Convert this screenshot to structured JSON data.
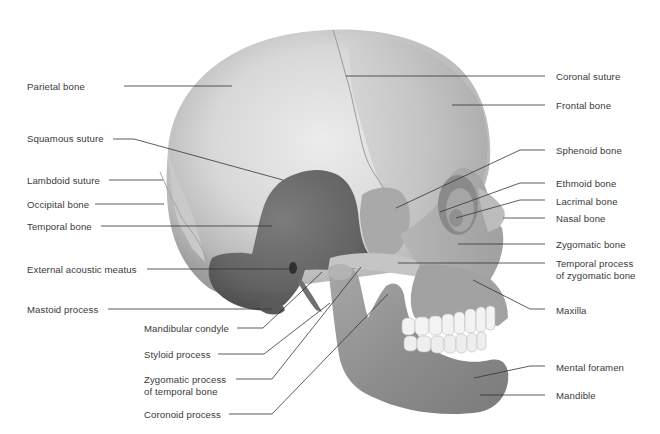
{
  "diagram": {
    "colors": {
      "background": "#ffffff",
      "bone_light": "#e2e2e2",
      "bone_mid": "#bdbdbd",
      "bone_dark": "#8f8f8f",
      "temporal": "#6d6d6d",
      "temporal_dark": "#555555",
      "teeth": "#f4f4f4",
      "leader_line": "#333333",
      "label_text": "#3a3a3a"
    },
    "labels_left": [
      {
        "id": "parietal-bone",
        "text": "Parietal bone",
        "x": 27,
        "y": 81,
        "line": [
          [
            124,
            86
          ],
          [
            232,
            86
          ]
        ]
      },
      {
        "id": "squamous-suture",
        "text": "Squamous suture",
        "x": 27,
        "y": 133,
        "line": [
          [
            113,
            139
          ],
          [
            134,
            139
          ],
          [
            283,
            180
          ]
        ]
      },
      {
        "id": "lambdoid-suture",
        "text": "Lambdoid suture",
        "x": 27,
        "y": 175,
        "line": [
          [
            109,
            180
          ],
          [
            163,
            180
          ]
        ]
      },
      {
        "id": "occipital-bone",
        "text": "Occipital bone",
        "x": 27,
        "y": 199,
        "line": [
          [
            95,
            204
          ],
          [
            164,
            204
          ]
        ]
      },
      {
        "id": "temporal-bone",
        "text": "Temporal bone",
        "x": 27,
        "y": 221,
        "line": [
          [
            101,
            226
          ],
          [
            272,
            226
          ]
        ]
      },
      {
        "id": "external-acoustic-meatus",
        "text": "External acoustic meatus",
        "x": 27,
        "y": 264,
        "line": [
          [
            147,
            269
          ],
          [
            291,
            269
          ]
        ]
      },
      {
        "id": "mastoid-process",
        "text": "Mastoid process",
        "x": 27,
        "y": 304,
        "line": [
          [
            108,
            309
          ],
          [
            272,
            309
          ]
        ]
      },
      {
        "id": "mandibular-condyle",
        "text": "Mandibular condyle",
        "x": 144,
        "y": 323,
        "line": [
          [
            237,
            328
          ],
          [
            263,
            328
          ],
          [
            322,
            272
          ]
        ]
      },
      {
        "id": "styloid-process",
        "text": "Styloid process",
        "x": 144,
        "y": 349,
        "line": [
          [
            218,
            354
          ],
          [
            264,
            354
          ],
          [
            330,
            303
          ]
        ]
      },
      {
        "id": "zygomatic-process-temporal",
        "text": "Zygomatic process\nof temporal bone",
        "x": 144,
        "y": 374,
        "line": [
          [
            236,
            379
          ],
          [
            272,
            379
          ],
          [
            361,
            267
          ]
        ]
      },
      {
        "id": "coronoid-process",
        "text": "Coronoid process",
        "x": 144,
        "y": 409,
        "line": [
          [
            229,
            414
          ],
          [
            272,
            414
          ],
          [
            388,
            294
          ]
        ]
      }
    ],
    "labels_right": [
      {
        "id": "coronal-suture",
        "text": "Coronal suture",
        "x": 556,
        "y": 71,
        "line": [
          [
            545,
            76
          ],
          [
            346,
            76
          ]
        ]
      },
      {
        "id": "frontal-bone",
        "text": "Frontal bone",
        "x": 556,
        "y": 100,
        "line": [
          [
            545,
            105
          ],
          [
            452,
            105
          ]
        ]
      },
      {
        "id": "sphenoid-bone",
        "text": "Sphenoid bone",
        "x": 556,
        "y": 145,
        "line": [
          [
            545,
            150
          ],
          [
            520,
            150
          ],
          [
            396,
            208
          ]
        ]
      },
      {
        "id": "ethmoid-bone",
        "text": "Ethmoid bone",
        "x": 556,
        "y": 178,
        "line": [
          [
            545,
            183
          ],
          [
            520,
            183
          ],
          [
            440,
            212
          ]
        ]
      },
      {
        "id": "lacrimal-bone",
        "text": "Lacrimal bone",
        "x": 556,
        "y": 196,
        "line": [
          [
            545,
            200
          ],
          [
            520,
            200
          ],
          [
            456,
            218
          ]
        ]
      },
      {
        "id": "nasal-bone",
        "text": "Nasal bone",
        "x": 556,
        "y": 213,
        "line": [
          [
            545,
            218
          ],
          [
            503,
            218
          ]
        ]
      },
      {
        "id": "zygomatic-bone",
        "text": "Zygomatic bone",
        "x": 556,
        "y": 239,
        "line": [
          [
            545,
            244
          ],
          [
            458,
            244
          ]
        ]
      },
      {
        "id": "temporal-process-zygomatic",
        "text": "Temporal process\nof zygomatic bone",
        "x": 556,
        "y": 258,
        "line": [
          [
            545,
            263
          ],
          [
            398,
            263
          ]
        ]
      },
      {
        "id": "maxilla",
        "text": "Maxilla",
        "x": 556,
        "y": 305,
        "line": [
          [
            545,
            309
          ],
          [
            530,
            309
          ],
          [
            473,
            280
          ]
        ]
      },
      {
        "id": "mental-foramen",
        "text": "Mental foramen",
        "x": 556,
        "y": 362,
        "line": [
          [
            545,
            366
          ],
          [
            530,
            366
          ],
          [
            474,
            378
          ]
        ]
      },
      {
        "id": "mandible",
        "text": "Mandible",
        "x": 556,
        "y": 390,
        "line": [
          [
            545,
            395
          ],
          [
            480,
            395
          ]
        ]
      }
    ]
  }
}
